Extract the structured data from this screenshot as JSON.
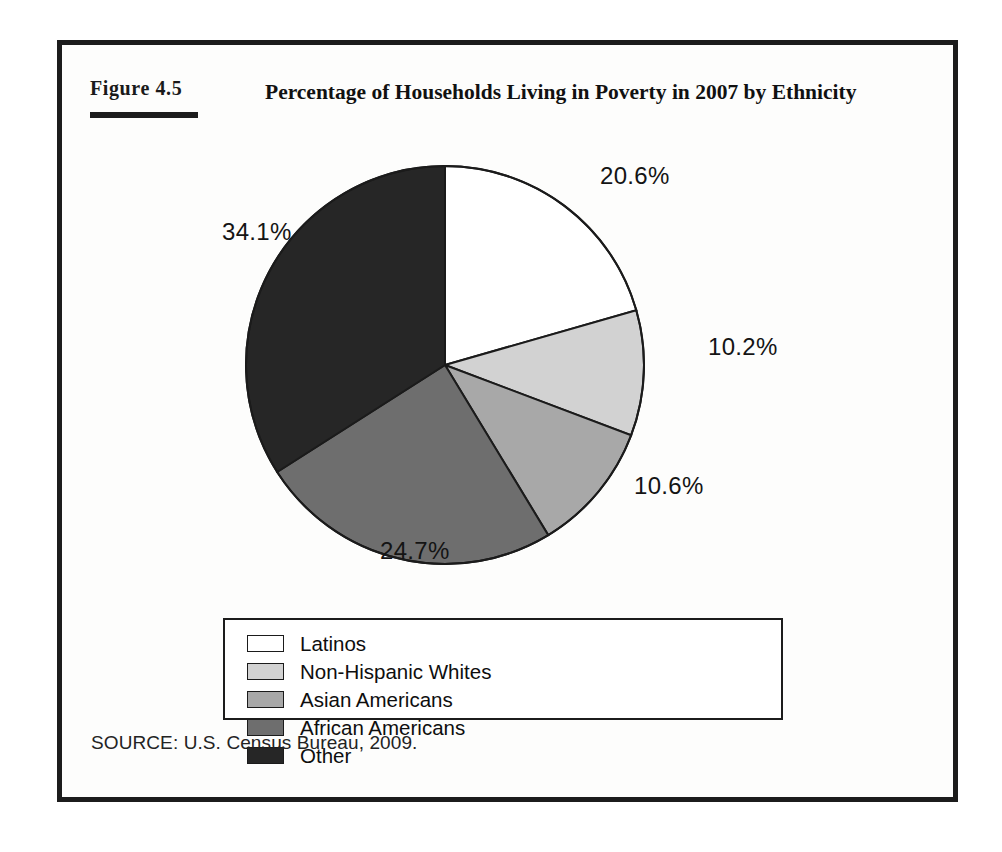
{
  "figure": {
    "label_word": "Figure",
    "label_number": "4.5",
    "label_full": "FIGURE 4.5",
    "title": "Percentage of Households Living in Poverty in 2007 by Ethnicity",
    "source": "SOURCE: U.S. Census Bureau, 2009."
  },
  "labels": {
    "latinos_pct": "20.6%",
    "nhwhites_pct": "10.2%",
    "asian_pct": "10.6%",
    "african_pct": "24.7%",
    "other_pct": "34.1%"
  },
  "legend": {
    "items": [
      {
        "label": "Latinos",
        "color": "#ffffff"
      },
      {
        "label": "Non-Hispanic Whites",
        "color": "#d2d2d2"
      },
      {
        "label": "Asian Americans",
        "color": "#a8a8a8"
      },
      {
        "label": "African Americans",
        "color": "#6e6e6e"
      },
      {
        "label": "Other",
        "color": "#262626"
      }
    ]
  },
  "chart_data": {
    "type": "pie",
    "title": "Percentage of Households Living in Poverty in 2007 by Ethnicity",
    "subtitle": "",
    "xlabel": "",
    "ylabel": "",
    "unit": "percent",
    "start_angle_deg": 0,
    "direction": "clockwise",
    "legend_position": "bottom",
    "grid": false,
    "categories": [
      "Latinos",
      "Non-Hispanic Whites",
      "Asian Americans",
      "African Americans",
      "Other"
    ],
    "values": [
      20.6,
      10.2,
      10.6,
      24.7,
      34.1
    ],
    "value_labels": [
      "20.6%",
      "10.2%",
      "10.6%",
      "24.7%",
      "34.1%"
    ],
    "colors": [
      "#ffffff",
      "#d2d2d2",
      "#a8a8a8",
      "#6e6e6e",
      "#262626"
    ],
    "slice_order_clockwise_from_top": [
      "Latinos",
      "Non-Hispanic Whites",
      "Asian Americans",
      "African Americans",
      "Other"
    ],
    "annotations": [
      "SOURCE: U.S. Census Bureau, 2009."
    ]
  }
}
